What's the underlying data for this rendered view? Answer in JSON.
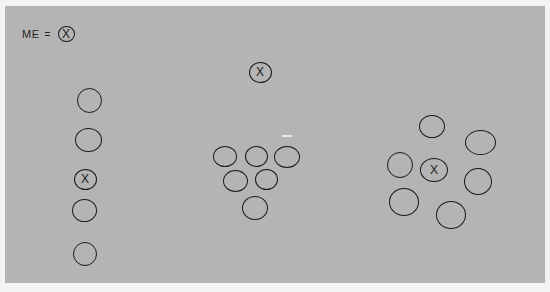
{
  "legend": {
    "label": "ME",
    "equals": "=",
    "symbol": "X"
  },
  "groups": [
    {
      "name": "vertical-column",
      "circles": [
        {
          "x": 89,
          "y": 100,
          "w": 25,
          "h": 25,
          "label": ""
        },
        {
          "x": 88,
          "y": 140,
          "w": 27,
          "h": 24,
          "label": ""
        },
        {
          "x": 85,
          "y": 179,
          "w": 23,
          "h": 21,
          "label": "X"
        },
        {
          "x": 84,
          "y": 210,
          "w": 25,
          "h": 23,
          "label": ""
        },
        {
          "x": 85,
          "y": 254,
          "w": 24,
          "h": 24,
          "label": ""
        }
      ]
    },
    {
      "name": "triangle-formation",
      "circles": [
        {
          "x": 260,
          "y": 72,
          "w": 23,
          "h": 21,
          "label": "X"
        },
        {
          "x": 225,
          "y": 156,
          "w": 24,
          "h": 21,
          "label": ""
        },
        {
          "x": 256,
          "y": 156,
          "w": 23,
          "h": 21,
          "label": ""
        },
        {
          "x": 287,
          "y": 157,
          "w": 26,
          "h": 22,
          "label": ""
        },
        {
          "x": 235,
          "y": 181,
          "w": 25,
          "h": 22,
          "label": ""
        },
        {
          "x": 266,
          "y": 179,
          "w": 23,
          "h": 21,
          "label": ""
        },
        {
          "x": 255,
          "y": 208,
          "w": 26,
          "h": 24,
          "label": ""
        }
      ]
    },
    {
      "name": "circle-formation",
      "circles": [
        {
          "x": 432,
          "y": 126,
          "w": 26,
          "h": 23,
          "label": ""
        },
        {
          "x": 480,
          "y": 142,
          "w": 31,
          "h": 25,
          "label": ""
        },
        {
          "x": 400,
          "y": 165,
          "w": 26,
          "h": 26,
          "label": ""
        },
        {
          "x": 434,
          "y": 170,
          "w": 28,
          "h": 24,
          "label": "X"
        },
        {
          "x": 478,
          "y": 181,
          "w": 28,
          "h": 27,
          "label": ""
        },
        {
          "x": 404,
          "y": 202,
          "w": 30,
          "h": 28,
          "label": ""
        },
        {
          "x": 451,
          "y": 215,
          "w": 30,
          "h": 28,
          "label": ""
        }
      ]
    }
  ],
  "colors": {
    "background": "#f3f3f3",
    "panel": "#b4b4b4",
    "ink": "#1a1a1a"
  }
}
